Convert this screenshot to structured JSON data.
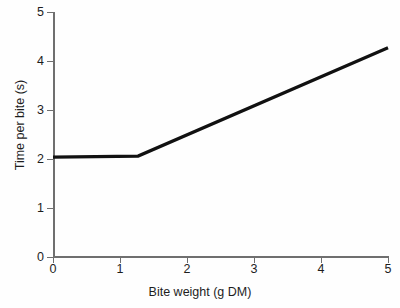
{
  "chart_data": {
    "type": "line",
    "title": "",
    "xlabel": "Bite weight (g DM)",
    "ylabel": "Time per bite (s)",
    "xlim": [
      0,
      5
    ],
    "ylim": [
      0,
      5
    ],
    "xticks": [
      "0",
      "1",
      "2",
      "3",
      "4",
      "5"
    ],
    "yticks": [
      "0",
      "1",
      "2",
      "3",
      "4",
      "5"
    ],
    "xtick_values": [
      0,
      1,
      2,
      3,
      4,
      5
    ],
    "ytick_values": [
      0,
      1,
      2,
      3,
      4,
      5
    ],
    "grid": false,
    "legend": false,
    "legend_position": "none",
    "line_color": "#111111",
    "axis_color": "#6f6f6f",
    "background_color": "#fefefe",
    "series": [
      {
        "name": "Time per bite",
        "x": [
          0.0,
          1.27,
          5.0
        ],
        "values": [
          2.04,
          2.06,
          4.27
        ],
        "breakpoint_x": 1.27,
        "plateau_y": 2.05,
        "slope_after_breakpoint": 0.59
      }
    ],
    "annotations": []
  }
}
